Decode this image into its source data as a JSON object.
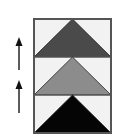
{
  "diagram": {
    "frame": {
      "x": 34,
      "y": 19,
      "width": 77,
      "height": 114,
      "stroke": "#555555",
      "band_fill": "#f2f2f2"
    },
    "bands": [
      {
        "name": "top-band",
        "y_top": 19,
        "y_bottom": 57,
        "triangle_fill": "#4a4a4a"
      },
      {
        "name": "middle-band",
        "y_top": 57,
        "y_bottom": 95,
        "triangle_fill": "#8c8c8c"
      },
      {
        "name": "bottom-band",
        "y_top": 95,
        "y_bottom": 133,
        "triangle_fill": "#050505"
      }
    ],
    "arrows": [
      {
        "name": "upper-arrow",
        "x": 19,
        "y_tip": 37,
        "y_tail": 70,
        "direction": "up",
        "color": "#333333"
      },
      {
        "name": "lower-arrow",
        "x": 19,
        "y_tip": 80,
        "y_tail": 113,
        "direction": "up",
        "color": "#333333"
      }
    ]
  }
}
